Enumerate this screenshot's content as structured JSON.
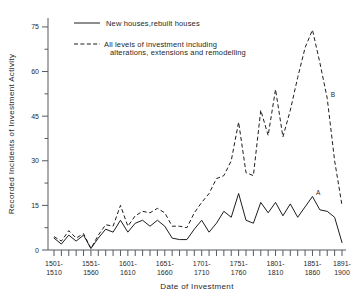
{
  "chart_data": {
    "type": "line",
    "title": "",
    "xlabel": "Date of Investment",
    "ylabel": "Recorded Incidents of Investment Activity",
    "ylim": [
      0,
      78
    ],
    "yticks": [
      0,
      15,
      30,
      45,
      60,
      75
    ],
    "ytick_labels": [
      "0",
      "15",
      "30",
      "45",
      "60",
      "75"
    ],
    "grid": false,
    "legend_position": "top-left",
    "x_decades": [
      "1501-1510",
      "1511-1520",
      "1521-1530",
      "1531-1540",
      "1541-1550",
      "1551-1560",
      "1561-1570",
      "1571-1580",
      "1581-1590",
      "1591-1600",
      "1601-1610",
      "1611-1620",
      "1621-1630",
      "1631-1640",
      "1641-1650",
      "1651-1660",
      "1661-1670",
      "1671-1680",
      "1681-1690",
      "1691-1700",
      "1701-1710",
      "1711-1720",
      "1721-1730",
      "1731-1740",
      "1741-1750",
      "1751-1760",
      "1761-1770",
      "1771-1780",
      "1781-1790",
      "1791-1800",
      "1801-1810",
      "1811-1820",
      "1821-1830",
      "1831-1840",
      "1841-1850",
      "1851-1860",
      "1861-1870",
      "1871-1880",
      "1881-1890",
      "1891-1900"
    ],
    "xtick_labels": [
      {
        "index": 0,
        "line1": "1501-",
        "line2": "1510"
      },
      {
        "index": 5,
        "line1": "1551-",
        "line2": "1560"
      },
      {
        "index": 10,
        "line1": "1601-",
        "line2": "1610"
      },
      {
        "index": 15,
        "line1": "1651-",
        "line2": "1660"
      },
      {
        "index": 20,
        "line1": "1701-",
        "line2": "1710"
      },
      {
        "index": 25,
        "line1": "1751-",
        "line2": "1760"
      },
      {
        "index": 30,
        "line1": "1801-",
        "line2": "1810"
      },
      {
        "index": 35,
        "line1": "1851-",
        "line2": "1860"
      },
      {
        "index": 39,
        "line1": "1891-",
        "line2": "1900"
      }
    ],
    "series": [
      {
        "name": "New houses,rebuilt houses",
        "style": "solid",
        "values": [
          4,
          2,
          5,
          3,
          5,
          0.5,
          4,
          7,
          6,
          10,
          6,
          9,
          10,
          8,
          10,
          8,
          4,
          3.5,
          3.5,
          7,
          10,
          6,
          9,
          13,
          11,
          19,
          10,
          9,
          16,
          12.5,
          16,
          11.5,
          15.5,
          11,
          14.5,
          18,
          13.5,
          13,
          11,
          2.5
        ]
      },
      {
        "name": "All levels of investment including alterations, extensions and remodelling",
        "style": "dashed",
        "values": [
          4.5,
          3,
          6.5,
          4,
          5.5,
          0.5,
          5,
          8.5,
          8,
          15,
          8,
          11.5,
          13,
          12.5,
          14,
          12.5,
          8,
          8,
          7.5,
          12.5,
          16,
          19,
          24,
          25,
          30,
          43,
          26,
          25,
          47,
          38.5,
          54,
          38,
          47,
          58,
          68,
          74,
          63,
          51,
          30,
          15
        ]
      }
    ],
    "annotations": [
      {
        "label": "A",
        "series": "New houses,rebuilt houses",
        "decade_index": 35
      },
      {
        "label": "B",
        "series": "All levels of investment including alterations, extensions and remodelling",
        "decade_index": 37
      }
    ]
  },
  "legend": {
    "entries": [
      {
        "label": "New houses,rebuilt houses",
        "style": "solid"
      },
      {
        "label_line1": "All levels of investment including",
        "label_line2": "alterations, extensions and remodelling",
        "style": "dashed"
      }
    ]
  },
  "axes": {
    "x_title": "Date of Investment",
    "y_title": "Recorded Incidents of Investment Activity"
  },
  "colors": {
    "ink": "#1d1d1d",
    "axis": "#555b60",
    "background": "#ffffff"
  }
}
